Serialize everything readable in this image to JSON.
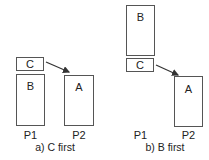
{
  "panels": [
    {
      "id": "a",
      "caption": "a) C first",
      "processors": [
        "P1",
        "P2"
      ],
      "boxes": {
        "C": "C",
        "B": "B",
        "A": "A"
      }
    },
    {
      "id": "b",
      "caption": "b) B first",
      "processors": [
        "P1",
        "P2"
      ],
      "boxes": {
        "B": "B",
        "C": "C",
        "A": "A"
      }
    }
  ],
  "colors": {
    "stroke": "#555555",
    "text": "#222222",
    "background": "#ffffff"
  }
}
